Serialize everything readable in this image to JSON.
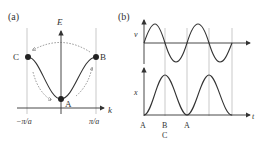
{
  "panel_a": {
    "label": "(a)",
    "y_axis_label": "E",
    "x_axis_label": "k",
    "x_ticks": [
      "−π/a",
      "π/a"
    ],
    "points": [
      {
        "name": "A",
        "desc": "band minimum at k=0"
      },
      {
        "name": "B",
        "desc": "band edge at k=π/a"
      },
      {
        "name": "C",
        "desc": "band edge at k=−π/a"
      }
    ]
  },
  "panel_b": {
    "label": "(b)",
    "top_plot_y_label": "v",
    "bottom_plot_y_label": "x",
    "x_axis_label": "t",
    "time_labels": [
      {
        "text": "A",
        "sub": ""
      },
      {
        "text": "B",
        "sub": "C"
      },
      {
        "text": "A",
        "sub": ""
      }
    ]
  },
  "colors": {
    "curve": "#333333",
    "guide_lines": "#bbbbbb",
    "dashed_arrows": "#666666"
  }
}
